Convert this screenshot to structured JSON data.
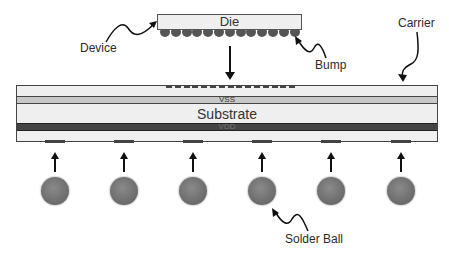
{
  "diagram": {
    "labels": {
      "die": "Die",
      "device": "Device",
      "bump": "Bump",
      "carrier": "Carrier",
      "vss": "VSS",
      "substrate": "Substrate",
      "vdd": "VDD",
      "solder_ball": "Solder Ball"
    },
    "bump_count": 13,
    "solder_ball_count": 6,
    "colors": {
      "outline": "#444444",
      "die_fill": "#efefef",
      "vss_fill": "#c8c8c8",
      "vdd_fill": "#444444",
      "ball_fill": "#6f6f6f"
    }
  }
}
